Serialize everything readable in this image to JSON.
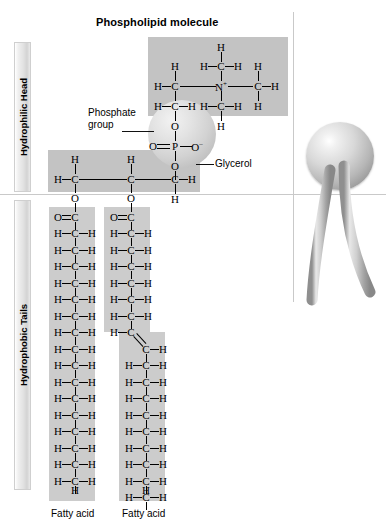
{
  "figure": {
    "title": "Phospholipid molecule",
    "background_color": "#ffffff",
    "highlight_color": "#c3c3c3",
    "rule_color": "#c9c9c9"
  },
  "regions": [
    {
      "key": "head",
      "label": "Hydrophilic Head"
    },
    {
      "key": "tails",
      "label": "Hydrophobic Tails"
    }
  ],
  "callouts": [
    {
      "key": "phosphate",
      "line1": "Phosphate",
      "line2": "group"
    },
    {
      "key": "glycerol",
      "line1": "Glycerol",
      "line2": ""
    }
  ],
  "captions": {
    "left_tail": "Fatty acid",
    "right_tail": "Fatty acid"
  },
  "atoms": {
    "H": "H",
    "C": "C",
    "N": "N",
    "O": "O",
    "P": "P",
    "N_plus": "N",
    "O_minus": "O",
    "plus": "+",
    "minus": "–"
  },
  "choline": {
    "description": "Quaternary ammonium choline head group",
    "top_H": "H",
    "top_CH": "H—C—H",
    "center_N": "N",
    "charge": "+",
    "left_H": "H",
    "left_C": "C",
    "right_C": "C",
    "right_H_top": "H",
    "right_H_side": "H",
    "right_H_bottom": "H",
    "lower_left_CH": "H—C—H",
    "lower_mid_CH": "H—C—H",
    "bottom_H": "H"
  },
  "phosphate": {
    "top_O": "O",
    "left_O": "O",
    "center_P": "P",
    "right_O": "O",
    "right_charge": "–",
    "bottom_O": "O"
  },
  "glycerol": {
    "c1_H_top": "H",
    "c1_H_left": "H",
    "c1": "C",
    "c1_O": "O",
    "c2_H_top": "H",
    "c2": "C",
    "c2_O": "O",
    "c3": "C",
    "c3_H_right": "H",
    "c3_H_bottom": "H"
  },
  "chart_data": {
    "type": "diagram",
    "title": "Phospholipid molecule",
    "left_tail": {
      "name": "Saturated fatty acid",
      "carbonyl": "O=C",
      "ch2_units": 16,
      "terminal": "H",
      "double_bonds": 0,
      "kinked": false
    },
    "right_tail": {
      "name": "Unsaturated fatty acid",
      "carbonyl": "O=C",
      "ch2_before_double_bond": 6,
      "double_bond": "C=C",
      "ch2_after_double_bond": 9,
      "terminal": "H",
      "double_bonds": 1,
      "kinked": true
    },
    "model_3d": {
      "head": "sphere",
      "tails": 2
    }
  }
}
